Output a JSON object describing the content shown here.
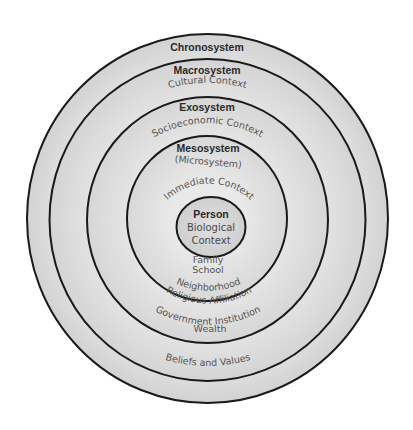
{
  "diagram": {
    "colors": {
      "background": "#ffffff",
      "ring_fill_light": "#e2e2e2",
      "ring_fill_dark": "#cfcfcf",
      "ring_stroke": "#1a1a1a",
      "label_text": "#2a2a2a",
      "sub_text": "#555555"
    },
    "layers": [
      {
        "name": "Chronosystem",
        "items": [],
        "bottom_items": []
      },
      {
        "name": "Macrosystem",
        "items": [
          "Cultural Context"
        ],
        "bottom_items": [
          "Beliefs and Values"
        ]
      },
      {
        "name": "Exosystem",
        "items": [
          "Socioeconomic Context"
        ],
        "bottom_items": [
          "Government Institution",
          "Wealth"
        ]
      },
      {
        "name": "Mesosystem",
        "items": [
          "(Microsystem)",
          "Immediate Context"
        ],
        "bottom_items": [
          "Family",
          "School",
          "Religious Affiliation",
          "Neighborhood"
        ]
      },
      {
        "name": "Person",
        "items": [
          "Biological",
          "Context"
        ],
        "bottom_items": []
      }
    ]
  }
}
